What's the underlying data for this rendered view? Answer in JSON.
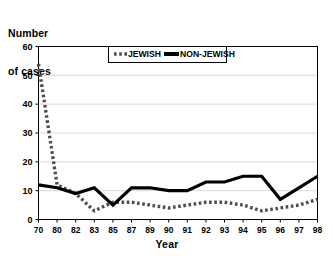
{
  "chart_data": {
    "type": "line",
    "title": "Number of cases",
    "title_lines": [
      "Number",
      "of cases"
    ],
    "xlabel": "Year",
    "ylabel": "Number of cases",
    "categories": [
      "70",
      "80",
      "82",
      "83",
      "85",
      "87",
      "89",
      "90",
      "91",
      "92",
      "93",
      "94",
      "95",
      "96",
      "97",
      "98"
    ],
    "ylim": [
      0,
      60
    ],
    "yticks": [
      0,
      10,
      20,
      30,
      40,
      50,
      60
    ],
    "ytick_labels": [
      "0",
      "10",
      "20",
      "30",
      "40",
      "50",
      "60"
    ],
    "grid": true,
    "grid_axis": "y",
    "legend_position": "upper center inside",
    "series": [
      {
        "name": "JEWISH",
        "style": "dotted",
        "color": "#4d4d4d",
        "values": [
          54,
          12,
          9,
          3,
          6,
          6,
          5,
          4,
          5,
          6,
          6,
          5,
          3,
          4,
          5,
          7
        ]
      },
      {
        "name": "NON-JEWISH",
        "style": "solid",
        "color": "#000000",
        "values": [
          12,
          11,
          9,
          11,
          5,
          11,
          11,
          10,
          10,
          13,
          13,
          15,
          15,
          7,
          11,
          15
        ]
      }
    ]
  },
  "legend": {
    "items": [
      {
        "label": "JEWISH",
        "swatch": "dotted-line-swatch"
      },
      {
        "label": "NON-JEWISH",
        "swatch": "solid-line-swatch"
      }
    ]
  },
  "colors": {
    "jewish": "#4d4d4d",
    "non_jewish": "#000000",
    "grid": "#d9d9d9",
    "axis": "#000000",
    "background": "#ffffff"
  }
}
